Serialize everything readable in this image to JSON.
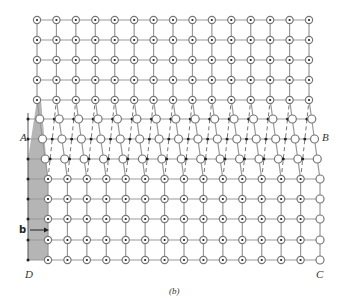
{
  "figure": {
    "caption": "(b)",
    "labels": {
      "A": "A",
      "B": "B",
      "C": "C",
      "D": "D",
      "burgers": "b"
    }
  },
  "grid": {
    "top_columns": 15,
    "x0": 37,
    "dx": 19.43,
    "top_rows_y": [
      20,
      40,
      60,
      80,
      100
    ],
    "mid_rows_y": [
      119,
      139,
      159
    ],
    "mid_shift": [
      3,
      6,
      9
    ],
    "bottom_rows_y": [
      179,
      199,
      219,
      240,
      260
    ],
    "bottom_shift": 11,
    "left_dot_x": 28
  },
  "colors": {
    "line": "#999999",
    "shade": "#b5b5b5",
    "circle_stroke": "#777777",
    "dot": "#222222"
  }
}
